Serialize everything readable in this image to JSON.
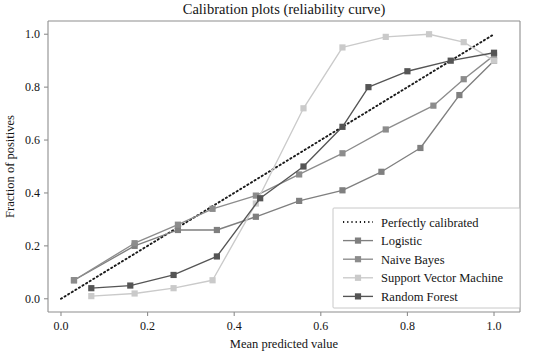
{
  "chart_data": {
    "type": "line",
    "title": "Calibration plots  (reliability curve)",
    "xlabel": "Mean predicted value",
    "ylabel": "Fraction of positives",
    "xlim": [
      -0.03,
      1.06
    ],
    "ylim": [
      -0.05,
      1.05
    ],
    "grid": false,
    "legend_position": "lower right",
    "xticks": [
      "0.0",
      "0.2",
      "0.4",
      "0.6",
      "0.8",
      "1.0"
    ],
    "xtick_values": [
      0.0,
      0.2,
      0.4,
      0.6,
      0.8,
      1.0
    ],
    "yticks": [
      "0.0",
      "0.2",
      "0.4",
      "0.6",
      "0.8",
      "1.0"
    ],
    "ytick_values": [
      0.0,
      0.2,
      0.4,
      0.6,
      0.8,
      1.0
    ],
    "series": [
      {
        "name": "Perfectly calibrated",
        "style": "dotted",
        "marker": "none",
        "color": "#1a1a1a",
        "x": [
          0.0,
          1.0
        ],
        "y": [
          0.0,
          1.0
        ]
      },
      {
        "name": "Logistic",
        "style": "solid",
        "marker": "square",
        "color": "#7f7f7f",
        "x": [
          0.03,
          0.17,
          0.27,
          0.36,
          0.45,
          0.55,
          0.65,
          0.74,
          0.83,
          0.92,
          1.0
        ],
        "y": [
          0.07,
          0.2,
          0.26,
          0.26,
          0.31,
          0.37,
          0.41,
          0.48,
          0.57,
          0.77,
          0.9
        ]
      },
      {
        "name": "Naive Bayes",
        "style": "solid",
        "marker": "square",
        "color": "#8c8c8c",
        "x": [
          0.03,
          0.17,
          0.27,
          0.35,
          0.45,
          0.55,
          0.65,
          0.75,
          0.86,
          0.93,
          1.0
        ],
        "y": [
          0.07,
          0.21,
          0.28,
          0.34,
          0.39,
          0.47,
          0.55,
          0.64,
          0.73,
          0.83,
          0.92
        ]
      },
      {
        "name": "Support Vector Machine",
        "style": "solid",
        "marker": "square",
        "color": "#cacaca",
        "x": [
          0.07,
          0.17,
          0.26,
          0.35,
          0.45,
          0.56,
          0.65,
          0.75,
          0.85,
          0.93,
          1.0
        ],
        "y": [
          0.01,
          0.02,
          0.04,
          0.07,
          0.36,
          0.72,
          0.95,
          0.99,
          1.0,
          0.97,
          0.9
        ]
      },
      {
        "name": "Random Forest",
        "style": "solid",
        "marker": "square",
        "color": "#555555",
        "x": [
          0.07,
          0.16,
          0.26,
          0.36,
          0.46,
          0.56,
          0.65,
          0.71,
          0.8,
          0.9,
          1.0
        ],
        "y": [
          0.04,
          0.05,
          0.09,
          0.16,
          0.38,
          0.5,
          0.65,
          0.8,
          0.86,
          0.9,
          0.93
        ]
      }
    ],
    "legend_entries": [
      "Perfectly calibrated",
      "Logistic",
      "Naive Bayes",
      "Support Vector Machine",
      "Random Forest"
    ]
  }
}
